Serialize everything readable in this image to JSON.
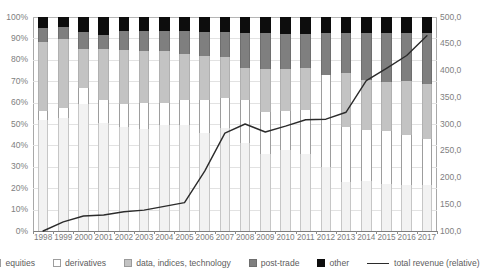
{
  "chart_data": {
    "type": "bar",
    "subtype": "100% stacked bar with secondary-axis line overlay",
    "title": "",
    "xlabel": "",
    "ylabel": "",
    "y2label": "",
    "grid": true,
    "legend_position": "bottom",
    "categories": [
      "1998",
      "1999",
      "2000",
      "2001",
      "2002",
      "2003",
      "2004",
      "2005",
      "2006",
      "2007",
      "2008",
      "2009",
      "2010",
      "2011",
      "2012",
      "2013",
      "2014",
      "2015",
      "2016",
      "2017"
    ],
    "ylim": [
      0,
      100
    ],
    "ytick_labels": [
      "0%",
      "10%",
      "20%",
      "30%",
      "40%",
      "50%",
      "60%",
      "70%",
      "80%",
      "90%",
      "100%"
    ],
    "ytick_values": [
      0,
      10,
      20,
      30,
      40,
      50,
      60,
      70,
      80,
      90,
      100
    ],
    "y2lim": [
      100,
      500
    ],
    "y2tick_labels": [
      "100,0",
      "150,0",
      "200,0",
      "250,0",
      "300,0",
      "350,0",
      "400,0",
      "450,0",
      "500,0"
    ],
    "y2tick_values": [
      100,
      150,
      200,
      250,
      300,
      350,
      400,
      450,
      500
    ],
    "series": [
      {
        "name": "equities",
        "color": "#f2f2f2",
        "values": [
          52.0,
          53.0,
          59.5,
          50.5,
          48.5,
          47.5,
          49.5,
          49.5,
          46.0,
          48.0,
          41.0,
          36.0,
          38.0,
          36.0,
          30.0,
          23.0,
          23.5,
          22.0,
          21.5,
          21.5
        ]
      },
      {
        "name": "derivatives",
        "color": "#ffffff",
        "values": [
          4.0,
          4.5,
          7.5,
          10.5,
          11.0,
          12.5,
          10.5,
          11.5,
          15.0,
          14.0,
          20.0,
          19.5,
          18.0,
          20.5,
          43.0,
          25.5,
          23.5,
          24.5,
          23.5,
          21.5
        ]
      },
      {
        "name": "data, indices, technology",
        "color": "#c3c3c3",
        "values": [
          32.5,
          32.5,
          25.5,
          24.0,
          24.5,
          24.0,
          24.0,
          21.5,
          20.5,
          19.5,
          15.0,
          19.5,
          19.5,
          19.5,
          0.0,
          25.5,
          23.5,
          23.0,
          25.0,
          25.5
        ]
      },
      {
        "name": "post-trade",
        "color": "#7f7f7f",
        "values": [
          0.0,
          0.0,
          0.0,
          0.0,
          0.0,
          0.0,
          0.0,
          0.0,
          0.0,
          0.0,
          0.0,
          0.0,
          0.0,
          0.0,
          0.0,
          0.0,
          0.0,
          0.0,
          0.0,
          0.0
        ]
      },
      {
        "name": "other",
        "color": "#0d0d0d",
        "values": [
          11.5,
          10.0,
          7.5,
          15.0,
          16.0,
          16.0,
          16.0,
          17.5,
          18.5,
          18.5,
          24.0,
          25.0,
          24.5,
          24.0,
          27.0,
          26.0,
          29.5,
          30.5,
          30.0,
          31.5
        ]
      }
    ],
    "stack_values": {
      "note": "cumulative tops (%) per bar, in stack order equities, derivatives, data-indices-technology, post-trade, other",
      "1998": [
        52.0,
        56.0,
        88.5,
        95.0,
        100.0
      ],
      "1999": [
        53.0,
        57.5,
        89.5,
        95.5,
        100.0
      ],
      "2000": [
        59.5,
        67.0,
        85.0,
        93.0,
        100.0
      ],
      "2001": [
        50.5,
        61.0,
        85.0,
        91.5,
        100.0
      ],
      "2002": [
        48.5,
        59.5,
        84.5,
        93.5,
        100.0
      ],
      "2003": [
        47.5,
        60.0,
        84.0,
        93.5,
        100.0
      ],
      "2004": [
        49.5,
        60.0,
        84.0,
        93.5,
        100.0
      ],
      "2005": [
        49.5,
        61.0,
        82.5,
        93.5,
        100.0
      ],
      "2006": [
        46.0,
        61.0,
        82.0,
        93.0,
        100.0
      ],
      "2007": [
        48.0,
        62.0,
        81.5,
        93.0,
        100.0
      ],
      "2008": [
        41.0,
        61.0,
        76.0,
        92.5,
        100.0
      ],
      "2009": [
        36.0,
        55.5,
        75.5,
        92.5,
        100.0
      ],
      "2010": [
        38.0,
        56.0,
        75.5,
        92.0,
        100.0
      ],
      "2011": [
        36.0,
        56.5,
        76.0,
        92.0,
        100.0
      ],
      "2012": [
        30.0,
        73.0,
        73.0,
        92.5,
        100.0
      ],
      "2013": [
        23.0,
        48.5,
        74.0,
        92.5,
        100.0
      ],
      "2014": [
        23.5,
        47.0,
        70.5,
        92.5,
        100.0
      ],
      "2015": [
        22.0,
        46.5,
        69.5,
        92.5,
        100.0
      ],
      "2016": [
        21.5,
        45.0,
        70.0,
        92.5,
        100.0
      ],
      "2017": [
        21.5,
        43.0,
        68.5,
        92.5,
        100.0
      ]
    },
    "line_series": {
      "name": "total revenue (relative)",
      "color": "#2b2b2b",
      "axis": "secondary",
      "values": [
        100.0,
        117.0,
        128.0,
        130.0,
        136.0,
        139.0,
        146.0,
        153.0,
        212.0,
        283.0,
        300.0,
        285.0,
        296.0,
        308.0,
        309.0,
        322.0,
        381.0,
        404.0,
        428.0,
        465.0
      ]
    },
    "legend": [
      {
        "label": "equities",
        "marker": "square",
        "color": "#f2f2f2"
      },
      {
        "label": "derivatives",
        "marker": "square",
        "color": "#ffffff"
      },
      {
        "label": "data, indices, technology",
        "marker": "square",
        "color": "#c3c3c3"
      },
      {
        "label": "post-trade",
        "marker": "square",
        "color": "#7f7f7f"
      },
      {
        "label": "other",
        "marker": "square",
        "color": "#0d0d0d"
      },
      {
        "label": "total revenue (relative)",
        "marker": "line",
        "color": "#2b2b2b"
      }
    ]
  }
}
